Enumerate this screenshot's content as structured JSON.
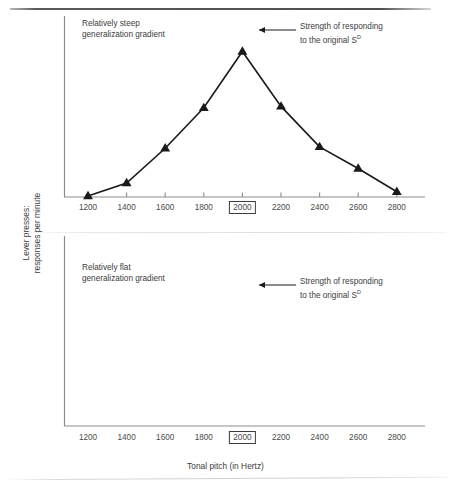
{
  "figure": {
    "y_axis_label": "Lever presses:\nresponses per minute",
    "x_axis_label": "Tonal pitch (in Hertz)",
    "tick_labels": [
      "1200",
      "1400",
      "1600",
      "1800",
      "2000",
      "2200",
      "2400",
      "2600",
      "2800"
    ],
    "boxed_tick": "2000",
    "annotation_line1": "Strength of responding",
    "annotation_line2": "to the original S",
    "annotation_superscript": "D",
    "panel_top_title": "Relatively steep\ngeneralization gradient",
    "panel_bottom_title": "Relatively flat\ngeneralization gradient",
    "line_color": "#1a1a1a",
    "axis_color": "#8c8c8c",
    "text_color": "#3c3c3c"
  },
  "chart_data": [
    {
      "type": "line",
      "title": "Relatively steep generalization gradient",
      "xlabel": "Tonal pitch (in Hertz)",
      "ylabel": "Lever presses: responses per minute",
      "x": [
        1200,
        1400,
        1600,
        1800,
        2000,
        2200,
        2400,
        2600,
        2800
      ],
      "tick_labels": [
        "1200",
        "1400",
        "1600",
        "1800",
        "2000",
        "2200",
        "2400",
        "2600",
        "2800"
      ],
      "values": [
        0,
        9,
        33,
        61,
        100,
        62,
        34,
        19,
        3
      ],
      "ylim": [
        0,
        110
      ],
      "xlim": [
        1200,
        2800
      ],
      "grid": false,
      "legend": "none",
      "marker": "triangle",
      "annotations": [
        {
          "at_x": 2000,
          "text": "Strength of responding to the original S^D"
        }
      ]
    },
    {
      "type": "line",
      "title": "Relatively flat generalization gradient",
      "xlabel": "Tonal pitch (in Hertz)",
      "ylabel": "Lever presses: responses per minute",
      "x": [
        1200,
        1400,
        1600,
        1800,
        2000,
        2200,
        2400,
        2600,
        2800
      ],
      "tick_labels": [
        "1200",
        "1400",
        "1600",
        "1800",
        "2000",
        "2200",
        "2400",
        "2600",
        "2800"
      ],
      "values": [
        51,
        67,
        82,
        87,
        100,
        81,
        71,
        64,
        42
      ],
      "ylim": [
        0,
        110
      ],
      "xlim": [
        1200,
        2800
      ],
      "grid": false,
      "legend": "none",
      "marker": "triangle",
      "annotations": [
        {
          "at_x": 2000,
          "text": "Strength of responding to the original S^D"
        }
      ]
    }
  ]
}
